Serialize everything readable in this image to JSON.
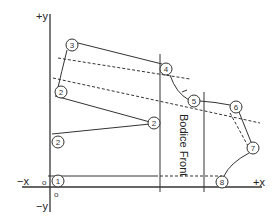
{
  "diagram": {
    "title": "Bodice Front",
    "axes": {
      "y_positive": "+y",
      "y_negative": "−y",
      "x_negative": "−x",
      "x_positive": "+x",
      "origin_left": "o",
      "origin_below": "o"
    },
    "points": [
      {
        "id": "p1",
        "label": "1",
        "x": 58,
        "y": 181
      },
      {
        "id": "p2a",
        "label": "2",
        "x": 61,
        "y": 92
      },
      {
        "id": "p2b",
        "label": "2",
        "x": 58,
        "y": 142
      },
      {
        "id": "p2c",
        "label": "2",
        "x": 154,
        "y": 123
      },
      {
        "id": "p3",
        "label": "3",
        "x": 72,
        "y": 45
      },
      {
        "id": "p4",
        "label": "4",
        "x": 166,
        "y": 69
      },
      {
        "id": "p5",
        "label": "5",
        "x": 194,
        "y": 101
      },
      {
        "id": "p6",
        "label": "6",
        "x": 236,
        "y": 107
      },
      {
        "id": "p7",
        "label": "7",
        "x": 253,
        "y": 148
      },
      {
        "id": "p8",
        "label": "8",
        "x": 222,
        "y": 182
      }
    ],
    "colors": {
      "line": "#333333",
      "background": "#ffffff"
    }
  }
}
